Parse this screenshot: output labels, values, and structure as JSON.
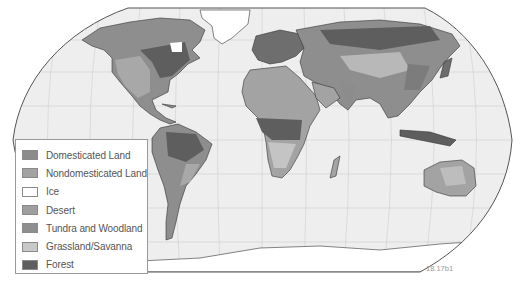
{
  "map": {
    "title": "World Biomes and Land Use",
    "projection": "Robinson",
    "colors": {
      "ocean": "#eeeeee",
      "graticule": "#cfcfcf",
      "outline": "#555555",
      "domesticated_land": "#8c8c8c",
      "nondomesticated_land": "#a3a3a3",
      "ice": "#ffffff",
      "desert": "#9e9e9e",
      "tundra_woodland": "#8e8e8e",
      "grassland_savanna": "#c8c8c8",
      "forest": "#5e5e5e"
    }
  },
  "legend": {
    "items": [
      {
        "label": "Domesticated Land",
        "color": "#8c8c8c"
      },
      {
        "label": "Nondomesticated Land",
        "color": "#a3a3a3"
      },
      {
        "label": "Ice",
        "color": "#ffffff"
      },
      {
        "label": "Desert",
        "color": "#9e9e9e"
      },
      {
        "label": "Tundra and Woodland",
        "color": "#8e8e8e"
      },
      {
        "label": "Grassland/Savanna",
        "color": "#c8c8c8"
      },
      {
        "label": "Forest",
        "color": "#5e5e5e"
      }
    ]
  },
  "figure_id": "18.17b1"
}
